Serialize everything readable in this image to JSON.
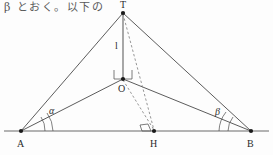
{
  "caption": {
    "text": "β とおく。以下の"
  },
  "figure": {
    "stroke_color": "#4a4a4a",
    "baseline_color": "#6b6b6b",
    "dash_color": "#8a8a8a",
    "point_color": "#1a1a1a",
    "background": "#fdfdfd",
    "points": [
      {
        "id": "T",
        "label": "T",
        "x": 123,
        "y": 13,
        "label_x": 120,
        "label_y": 1
      },
      {
        "id": "O",
        "label": "O",
        "x": 123,
        "y": 79,
        "label_x": 118,
        "label_y": 85
      },
      {
        "id": "A",
        "label": "A",
        "x": 21,
        "y": 131,
        "label_x": 17,
        "label_y": 139
      },
      {
        "id": "H",
        "label": "H",
        "x": 154,
        "y": 131,
        "label_x": 150,
        "label_y": 139
      },
      {
        "id": "B",
        "label": "B",
        "x": 251,
        "y": 131,
        "label_x": 247,
        "label_y": 139
      }
    ],
    "solid_segments": [
      {
        "name": "segment-T-A",
        "from": "T",
        "to": "A"
      },
      {
        "name": "segment-T-B",
        "from": "T",
        "to": "B"
      },
      {
        "name": "segment-O-A",
        "from": "O",
        "to": "A"
      },
      {
        "name": "segment-O-B",
        "from": "O",
        "to": "B"
      },
      {
        "name": "segment-T-O",
        "from": "T",
        "to": "O"
      }
    ],
    "baseline": {
      "name": "baseline-A-B",
      "x1": 4,
      "y1": 131,
      "x2": 269,
      "y2": 131
    },
    "dashed_segments": [
      {
        "name": "segment-T-H",
        "from": "T",
        "to": "H"
      },
      {
        "name": "segment-O-H",
        "from": "O",
        "to": "H"
      }
    ],
    "length_labels": [
      {
        "id": "l",
        "text": "l",
        "x": 115,
        "y": 41,
        "for": "segment-T-O"
      }
    ],
    "angle_labels": [
      {
        "id": "alpha",
        "text": "α",
        "x": 49,
        "y": 106,
        "vertex": "A"
      },
      {
        "id": "beta",
        "text": "β",
        "x": 215,
        "y": 107,
        "vertex": "B"
      }
    ],
    "right_angle_markers": [
      {
        "name": "right-angle-at-O",
        "vertex": "O"
      },
      {
        "name": "right-angle-at-H",
        "vertex": "H"
      }
    ],
    "angle_arcs": [
      {
        "name": "angle-arc-alpha",
        "vertex": "A"
      },
      {
        "name": "angle-arc-beta",
        "vertex": "B"
      }
    ]
  }
}
